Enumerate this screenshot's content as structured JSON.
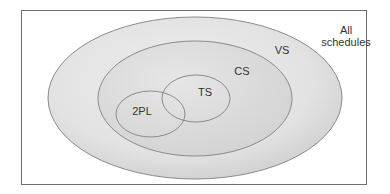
{
  "diagram": {
    "type": "venn",
    "sets": [
      {
        "id": "all",
        "label_line1": "All",
        "label_line2": "schedules"
      },
      {
        "id": "vs",
        "label": "VS"
      },
      {
        "id": "cs",
        "label": "CS"
      },
      {
        "id": "ts",
        "label": "TS"
      },
      {
        "id": "2pl",
        "label": "2PL"
      }
    ],
    "relations": [
      "VS within All schedules",
      "CS within VS",
      "TS within CS",
      "2PL within CS",
      "TS overlaps 2PL"
    ],
    "colors": {
      "stroke": "#8a8a8a",
      "fill_light": "#f2f2f2",
      "fill_dark": "#c8c8c8",
      "frame": "#6e6e6e",
      "text": "#333333"
    }
  }
}
